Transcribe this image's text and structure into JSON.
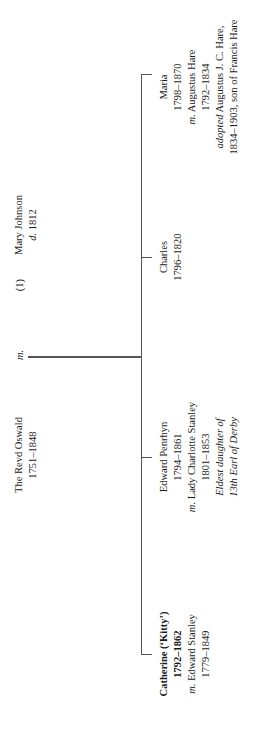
{
  "parents": {
    "father": {
      "name": "The Revd Oswald",
      "dates": "1751–1848"
    },
    "marriage_marker": "m.",
    "mother_index": "(1)",
    "mother": {
      "name": "Mary Johnson",
      "dates_prefix": "d.",
      "dates": "1812"
    }
  },
  "children": [
    {
      "name": "Catherine (‘Kitty’)",
      "dates": "1792–1862",
      "spouse_prefix": "m.",
      "spouse": "Edward Stanley",
      "spouse_dates": "1779–1849"
    },
    {
      "name": "Edward Penrhyn",
      "dates": "1794–1861",
      "spouse_prefix": "m.",
      "spouse": "Lady Charlotte Stanley",
      "spouse_dates": "1801–1853",
      "note_line1": "Eldest daughter of",
      "note_line2": "13th Earl of Derby"
    },
    {
      "name": "Charles",
      "dates": "1796–1820"
    },
    {
      "name": "Maria",
      "dates": "1798–1870",
      "spouse_prefix": "m.",
      "spouse": "Augustus Hare",
      "spouse_dates": "1792–1834",
      "adopted_prefix": "adopted",
      "adopted": "Augustus J. C. Hare,",
      "adopted_line2": "1834–1903, son of Francis Hare"
    }
  ]
}
